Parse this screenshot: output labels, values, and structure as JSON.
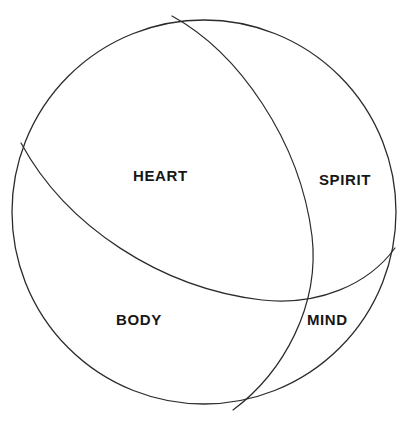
{
  "diagram": {
    "type": "venn-sphere",
    "stroke_color": "#2b2b2b",
    "fill_color": "#ffffff",
    "background_color": "#ffffff",
    "label_color": "#171717",
    "stroke_width": 1.2,
    "sphere": {
      "center_x": 204,
      "center_y": 212,
      "radius": 192
    },
    "labels": [
      {
        "key": "heart",
        "text": "HEART",
        "x": 133,
        "y": 168
      },
      {
        "key": "spirit",
        "text": "SPIRIT",
        "x": 319,
        "y": 172
      },
      {
        "key": "body",
        "text": "BODY",
        "x": 116,
        "y": 312
      },
      {
        "key": "mind",
        "text": "MIND",
        "x": 307,
        "y": 312
      }
    ],
    "dividers": [
      {
        "key": "spirit-mind-divider",
        "description": "vertical great-circle arc separating SPIRIT/MIND from HEART/BODY",
        "start_x": 172,
        "start_y": 16,
        "end_x": 233,
        "end_y": 410
      },
      {
        "key": "heart-body-divider",
        "description": "horizontal great-circle arc separating HEART/SPIRIT from BODY/MIND",
        "start_x": 21,
        "start_y": 143,
        "end_x": 395,
        "end_y": 248
      }
    ]
  }
}
